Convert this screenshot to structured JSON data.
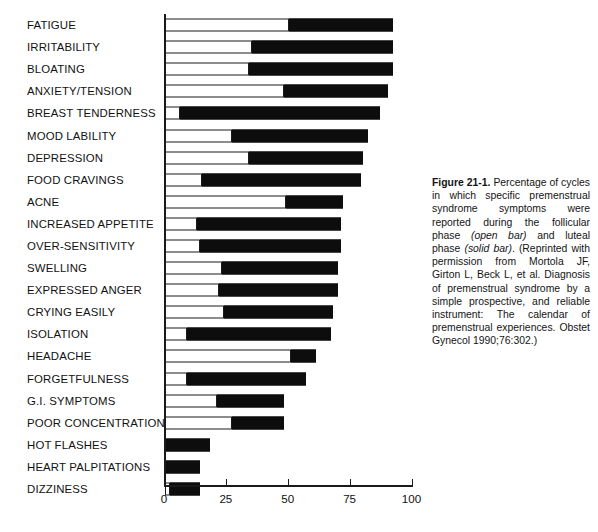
{
  "figure": {
    "caption_label": "Figure 21-1.",
    "caption_body": " Percentage of cycles in which specific premenstrual syndrome symptoms were reported during the follicular phase ",
    "caption_em1": "(open bar)",
    "caption_mid": " and luteal phase ",
    "caption_em2": "(solid bar)",
    "caption_end": ". (Reprinted with permission from Mortola JF, Girton L, Beck L, et al. Diagnosis of premenstrual syndrome by a simple prospective, and reliable instrument: The calendar of premenstrual experiences. Obstet Gynecol 1990;76:302.)"
  },
  "chart_data": {
    "type": "bar",
    "orientation": "horizontal",
    "stacked": true,
    "title": "",
    "xlabel": "",
    "ylabel": "",
    "xlim": [
      0,
      100
    ],
    "xticks": [
      0,
      25,
      50,
      75,
      100
    ],
    "xtick_labels": [
      "0",
      "25",
      "50",
      "75",
      "100"
    ],
    "grid": false,
    "legend": [
      "open bar (follicular phase)",
      "solid bar (luteal phase)"
    ],
    "legend_position": "none",
    "categories": [
      "FATIGUE",
      "IRRITABILITY",
      "BLOATING",
      "ANXIETY/TENSION",
      "BREAST TENDERNESS",
      "MOOD LABILITY",
      "DEPRESSION",
      "FOOD CRAVINGS",
      "ACNE",
      "INCREASED APPETITE",
      "OVER-SENSITIVITY",
      "SWELLING",
      "EXPRESSED ANGER",
      "CRYING EASILY",
      "ISOLATION",
      "HEADACHE",
      "FORGETFULNESS",
      "G.I. SYMPTOMS",
      "POOR CONCENTRATION",
      "HOT FLASHES",
      "HEART PALPITATIONS",
      "DIZZINESS"
    ],
    "series": [
      {
        "name": "follicular phase (open bar)",
        "color": "#ffffff",
        "values": [
          50,
          35,
          34,
          48,
          6,
          27,
          34,
          15,
          49,
          13,
          14,
          23,
          22,
          24,
          9,
          51,
          9,
          21,
          27,
          0,
          0,
          2
        ]
      },
      {
        "name": "luteal phase (solid bar)",
        "color": "#0d0d0d",
        "values": [
          42,
          57,
          58,
          42,
          81,
          55,
          46,
          64,
          23,
          58,
          57,
          47,
          48,
          44,
          58,
          10,
          48,
          27,
          21,
          18,
          14,
          12
        ]
      }
    ],
    "totals": [
      92,
      92,
      92,
      90,
      87,
      82,
      80,
      79,
      72,
      71,
      71,
      70,
      70,
      68,
      67,
      61,
      57,
      48,
      48,
      18,
      14,
      14
    ]
  }
}
